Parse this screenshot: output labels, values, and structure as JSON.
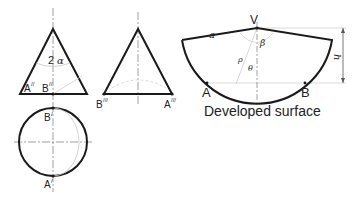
{
  "diagram": {
    "type": "cone-development",
    "views": {
      "front": {
        "labels": {
          "apex_angle": "2",
          "alpha": "α",
          "point_a": "A",
          "point_a_sup": "//",
          "point_b": "B",
          "point_b_sup": "//"
        }
      },
      "side": {
        "labels": {
          "point_b": "B",
          "point_b_sup": "///",
          "point_a": "A",
          "point_a_sup": "///"
        }
      },
      "top": {
        "labels": {
          "point_b": "B",
          "point_b_sup": "/",
          "point_a": "A",
          "point_a_sup": "/"
        }
      },
      "developed": {
        "title": "Developed surface",
        "labels": {
          "vertex": "V",
          "slant": "a",
          "beta": "β",
          "rho": "ρ",
          "theta": "θ",
          "height": "h",
          "point_a": "A",
          "point_b": "B"
        }
      }
    },
    "colors": {
      "outline": "#1a1a1a",
      "centerline": "#888888",
      "construction": "#c8c8c8"
    }
  }
}
